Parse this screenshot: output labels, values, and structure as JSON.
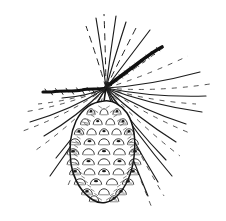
{
  "image": {
    "title": "Pine cone on branch",
    "subject": "pine-cone",
    "medium": "pen-and-ink line drawing",
    "background_color": "#ffffff",
    "ink_color": "#1a1a1a",
    "width": 226,
    "height": 221
  },
  "caption": "",
  "chart_data": {
    "type": "line",
    "xlabel": "",
    "ylabel": "",
    "grid": false,
    "legend": "none",
    "xlim": [
      0,
      226
    ],
    "ylim": [
      0,
      221
    ],
    "note": "Botanical line illustration; coordinates are drawing geometry in image pixel space (y increases downward).",
    "annotations": [
      {
        "name": "cone-body",
        "center": [
          104,
          152
        ],
        "rx": 32,
        "ry": 50,
        "rotation_deg": -4
      },
      {
        "name": "branch-junction",
        "point": [
          106,
          88
        ]
      },
      {
        "name": "branch-left-tip",
        "point": [
          42,
          92
        ]
      },
      {
        "name": "branch-upper-right-tip",
        "point": [
          162,
          48
        ]
      },
      {
        "name": "cone-stem",
        "from": [
          106,
          90
        ],
        "to": [
          104,
          104
        ]
      }
    ],
    "series": [
      {
        "name": "cone-outline",
        "values": [
          [
            104,
            102
          ],
          [
            86,
            108
          ],
          [
            75,
            124
          ],
          [
            71,
            146
          ],
          [
            74,
            170
          ],
          [
            84,
            190
          ],
          [
            98,
            201
          ],
          [
            112,
            198
          ],
          [
            126,
            182
          ],
          [
            134,
            160
          ],
          [
            135,
            136
          ],
          [
            127,
            117
          ],
          [
            115,
            105
          ],
          [
            104,
            102
          ]
        ]
      },
      {
        "name": "branch-left",
        "values": [
          [
            42,
            92
          ],
          [
            58,
            90
          ],
          [
            74,
            91
          ],
          [
            90,
            89
          ],
          [
            106,
            88
          ]
        ]
      },
      {
        "name": "branch-upper-right",
        "values": [
          [
            106,
            88
          ],
          [
            122,
            77
          ],
          [
            138,
            65
          ],
          [
            152,
            55
          ],
          [
            162,
            48
          ]
        ]
      },
      {
        "name": "needles-count",
        "values": [
          [
            0,
            34
          ]
        ]
      }
    ]
  },
  "geometry": {
    "cone": {
      "outline": "M104,101 C92,102 82,109 76,121 C70,134 69,150 71,164 C74,180 82,193 93,200 C101,205 110,203 117,196 C126,187 132,173 134,157 C136,140 134,124 127,113 C120,104 112,100 104,101 Z",
      "center_x": 104,
      "center_y": 152,
      "top_y": 101,
      "bottom_y": 203,
      "left_x": 69,
      "right_x": 136
    },
    "stem": "M106,89 C105,94 104,99 104,104",
    "branch_left": "M106,88 C98,90 90,88 82,90 C72,92 62,90 52,92 L43,92",
    "branch_left_width": 3.2,
    "branch_right": "M106,87 C116,80 126,72 137,64 C146,57 154,51 162,47",
    "branch_right_width": 3.6,
    "origin": {
      "x": 106,
      "y": 88
    },
    "scale_rows": [
      {
        "y": 110,
        "count": 3,
        "width": 26
      },
      {
        "y": 120,
        "count": 4,
        "width": 38
      },
      {
        "y": 130,
        "count": 5,
        "width": 50
      },
      {
        "y": 140,
        "count": 5,
        "width": 58
      },
      {
        "y": 150,
        "count": 5,
        "width": 62
      },
      {
        "y": 160,
        "count": 5,
        "width": 62
      },
      {
        "y": 170,
        "count": 5,
        "width": 58
      },
      {
        "y": 180,
        "count": 4,
        "width": 48
      },
      {
        "y": 190,
        "count": 3,
        "width": 34
      },
      {
        "y": 197,
        "count": 2,
        "width": 20
      }
    ],
    "needles": [
      {
        "id": 1,
        "to": [
          96,
          18
        ],
        "style": "solid",
        "width": 1.2,
        "curve": -4
      },
      {
        "id": 2,
        "to": [
          104,
          14
        ],
        "style": "dash",
        "width": 1.0,
        "curve": -2
      },
      {
        "id": 3,
        "to": [
          116,
          16
        ],
        "style": "solid",
        "width": 1.3,
        "curve": 3
      },
      {
        "id": 4,
        "to": [
          126,
          22
        ],
        "style": "solid",
        "width": 1.1,
        "curve": 5
      },
      {
        "id": 5,
        "to": [
          136,
          28
        ],
        "style": "dash",
        "width": 1.0,
        "curve": 7
      },
      {
        "id": 6,
        "to": [
          150,
          30
        ],
        "style": "solid",
        "width": 1.2,
        "curve": 9
      },
      {
        "id": 7,
        "to": [
          86,
          26
        ],
        "style": "dash",
        "width": 1.0,
        "curve": -6
      },
      {
        "id": 8,
        "to": [
          168,
          44
        ],
        "style": "dash",
        "width": 0.9,
        "curve": 10
      },
      {
        "id": 9,
        "to": [
          188,
          56
        ],
        "style": "dash",
        "width": 0.9,
        "curve": 14
      },
      {
        "id": 10,
        "to": [
          200,
          72
        ],
        "style": "solid",
        "width": 1.1,
        "curve": 16
      },
      {
        "id": 11,
        "to": [
          210,
          84
        ],
        "style": "dash",
        "width": 0.9,
        "curve": 18
      },
      {
        "id": 12,
        "to": [
          206,
          96
        ],
        "style": "solid",
        "width": 1.2,
        "curve": 16
      },
      {
        "id": 13,
        "to": [
          196,
          104
        ],
        "style": "dash",
        "width": 0.9,
        "curve": 14
      },
      {
        "id": 14,
        "to": [
          202,
          112
        ],
        "style": "solid",
        "width": 1.1,
        "curve": 14
      },
      {
        "id": 15,
        "to": [
          186,
          124
        ],
        "style": "solid",
        "width": 1.2,
        "curve": 12
      },
      {
        "id": 16,
        "to": [
          192,
          134
        ],
        "style": "dash",
        "width": 0.9,
        "curve": 12
      },
      {
        "id": 17,
        "to": [
          176,
          142
        ],
        "style": "solid",
        "width": 1.2,
        "curve": 10
      },
      {
        "id": 18,
        "to": [
          180,
          156
        ],
        "style": "dash",
        "width": 0.9,
        "curve": 10
      },
      {
        "id": 19,
        "to": [
          166,
          160
        ],
        "style": "solid",
        "width": 1.2,
        "curve": 8
      },
      {
        "id": 20,
        "to": [
          172,
          176
        ],
        "style": "solid",
        "width": 1.0,
        "curve": 8
      },
      {
        "id": 21,
        "to": [
          158,
          182
        ],
        "style": "solid",
        "width": 1.1,
        "curve": 6
      },
      {
        "id": 22,
        "to": [
          164,
          196
        ],
        "style": "dash",
        "width": 0.9,
        "curve": 6
      },
      {
        "id": 23,
        "to": [
          148,
          196
        ],
        "style": "solid",
        "width": 1.0,
        "curve": 4
      },
      {
        "id": 24,
        "to": [
          152,
          208
        ],
        "style": "dash",
        "width": 0.8,
        "curve": 4
      },
      {
        "id": 25,
        "to": [
          62,
          98
        ],
        "style": "solid",
        "width": 1.2,
        "curve": -10
      },
      {
        "id": 26,
        "to": [
          38,
          104
        ],
        "style": "dash",
        "width": 0.9,
        "curve": -12
      },
      {
        "id": 27,
        "to": [
          24,
          112
        ],
        "style": "dash",
        "width": 0.9,
        "curve": -14
      },
      {
        "id": 28,
        "to": [
          30,
          122
        ],
        "style": "solid",
        "width": 1.1,
        "curve": -14
      },
      {
        "id": 29,
        "to": [
          20,
          132
        ],
        "style": "dash",
        "width": 0.9,
        "curve": -16
      },
      {
        "id": 30,
        "to": [
          44,
          136
        ],
        "style": "solid",
        "width": 1.2,
        "curve": -12
      },
      {
        "id": 31,
        "to": [
          36,
          150
        ],
        "style": "dash",
        "width": 0.9,
        "curve": -12
      },
      {
        "id": 32,
        "to": [
          56,
          158
        ],
        "style": "solid",
        "width": 1.2,
        "curve": -8
      },
      {
        "id": 33,
        "to": [
          50,
          176
        ],
        "style": "solid",
        "width": 1.1,
        "curve": -8
      },
      {
        "id": 34,
        "to": [
          66,
          190
        ],
        "style": "dash",
        "width": 0.9,
        "curve": -5
      }
    ]
  }
}
